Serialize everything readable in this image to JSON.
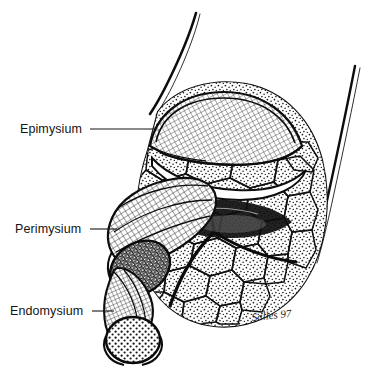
{
  "figure": {
    "style": "pen-and-ink line drawing, stippled and cross-hatched",
    "background_color": "#ffffff",
    "ink_color": "#0d0d0d"
  },
  "labels": [
    {
      "id": "epimysium",
      "text": "Epimysium",
      "text_x": 20,
      "text_y": 133,
      "leader_x1": 90,
      "leader_y1": 129,
      "leader_x2": 157,
      "leader_y2": 129
    },
    {
      "id": "perimysium",
      "text": "Perimysium",
      "text_x": 15,
      "text_y": 233,
      "leader_x1": 90,
      "leader_y1": 229,
      "leader_x2": 117,
      "leader_y2": 229
    },
    {
      "id": "endomysium",
      "text": "Endomysium",
      "text_x": 10,
      "text_y": 315,
      "leader_x1": 92,
      "leader_y1": 311,
      "leader_x2": 114,
      "leader_y2": 311
    }
  ],
  "signature": {
    "text": "Salles 97",
    "x": 252,
    "y": 321
  },
  "structures": [
    {
      "name": "epimysium-outer-sheath",
      "description": "outer fibrous sheath wrapping whole muscle belly"
    },
    {
      "name": "epimysium-reflected-flap",
      "description": "cross-hatched sheath flap peeled back over top of muscle"
    },
    {
      "name": "muscle-fascicles",
      "description": "stippled polygonal fascicle bundles filling the muscle belly"
    },
    {
      "name": "perimysium-tube",
      "description": "cross-hatched cylindrical sheath around one fascicle, cut open at left"
    },
    {
      "name": "perimysium-cross-section",
      "description": "dark stippled circular cut face of the fascicle"
    },
    {
      "name": "endomysium-tube",
      "description": "narrow cross-hatched sheath around a single muscle fiber"
    },
    {
      "name": "endomysium-cross-section",
      "description": "dotted circular cut face of the single muscle fiber"
    },
    {
      "name": "tendon-fiber-upper-left",
      "description": "thin tapering fiber extending up-left from muscle"
    },
    {
      "name": "tendon-fiber-right",
      "description": "thin tapering fiber extending up-right from muscle"
    }
  ]
}
